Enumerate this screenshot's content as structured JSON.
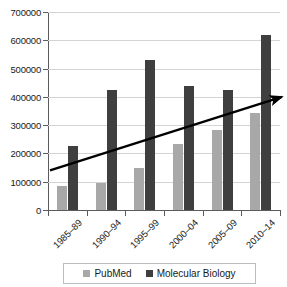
{
  "chart_data": {
    "type": "bar",
    "title": "",
    "subtitle": "",
    "xlabel": "",
    "ylabel": "",
    "categories": [
      "1985–89",
      "1990–94",
      "1995–99",
      "2000–04",
      "2005–09",
      "2010–14"
    ],
    "series": [
      {
        "name": "PubMed",
        "color": "#a8a8a8",
        "values": [
          85000,
          95000,
          150000,
          235000,
          282000,
          343000
        ]
      },
      {
        "name": "Molecular Biology",
        "color": "#3f3f3f",
        "values": [
          225000,
          425000,
          530000,
          440000,
          425000,
          620000
        ]
      }
    ],
    "ylim": [
      0,
      700000
    ],
    "ytick_values": [
      0,
      100000,
      200000,
      300000,
      400000,
      500000,
      600000,
      700000
    ],
    "ytick_labels": [
      "0",
      "100000",
      "200000",
      "300000",
      "400000",
      "500000",
      "600000",
      "700000"
    ],
    "grid": true,
    "legend_position": "bottom",
    "annotations": [
      {
        "type": "trend-arrow",
        "start_value": 140000,
        "end_value": 400000,
        "color": "#000000"
      }
    ]
  },
  "legend": {
    "items": [
      {
        "label": "PubMed",
        "swatch": "legend-swatch-pubmed"
      },
      {
        "label": "Molecular Biology",
        "swatch": "legend-swatch-molbio"
      }
    ]
  }
}
